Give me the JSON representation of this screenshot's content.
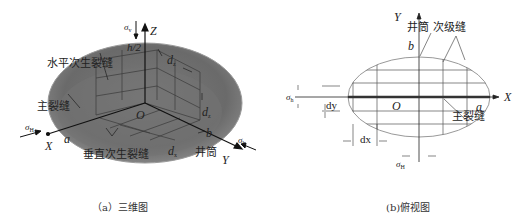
{
  "figure": {
    "panels": [
      {
        "id": "a",
        "caption": "（a）三维图",
        "labels": {
          "sigma_v": "σ",
          "sigma_v_sub": "v",
          "z_axis": "Z",
          "h_half": "h/2",
          "dz_top": "d",
          "dz_top_sub": "z",
          "horizontal_secondary_fracture": "水平次生裂缝",
          "dz_side": "d",
          "dz_side_sub": "z",
          "main_fracture": "主裂缝",
          "origin": "O",
          "sigma_H": "σ",
          "sigma_H_sub": "H",
          "a": "a",
          "x_axis": "X",
          "b": "b",
          "vertical_secondary_fracture": "垂直次生裂缝",
          "dx_bottom": "d",
          "dx_bottom_sub": "x",
          "wellbore": "井筒",
          "y_axis": "Y",
          "sigma_h": "σ",
          "sigma_h_sub": "h"
        },
        "colors": {
          "ellipsoid": "#6e6e6e",
          "ellipsoid_edge": "#8a8a8a",
          "grid": "#3a3a3a"
        }
      },
      {
        "id": "b",
        "caption": "(b)俯视图",
        "labels": {
          "y_axis": "Y",
          "wellbore": "井筒",
          "secondary_fracture": "次级缝",
          "b": "b",
          "sigma_h": "σ",
          "sigma_h_sub": "h",
          "origin": "O",
          "a": "a",
          "x_axis": "X",
          "dy": "dy",
          "main_fracture": "主裂缝",
          "dx": "dx",
          "sigma_H": "σ",
          "sigma_H_sub": "H"
        },
        "colors": {
          "ellipse": "#999999",
          "grid": "#555555",
          "main_fracture": "#333333"
        }
      }
    ]
  }
}
